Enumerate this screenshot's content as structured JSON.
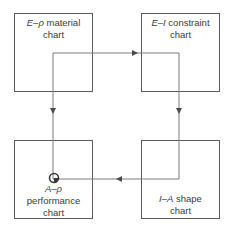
{
  "diagram": {
    "type": "flow-cycle",
    "boxes": [
      {
        "id": "material",
        "var1": "E",
        "dash": "–",
        "var2": "ρ",
        "line1_rest": " material",
        "line2": "chart"
      },
      {
        "id": "constraint",
        "var1": "E",
        "dash": "–",
        "var2": "I",
        "line1_rest": " constraint",
        "line2": "chart"
      },
      {
        "id": "performance",
        "var1": "A",
        "dash": "–",
        "var2": "ρ",
        "line2": "performance",
        "line3": "chart"
      },
      {
        "id": "shape",
        "var1": "I",
        "dash": "–",
        "var2": "A",
        "line1_rest": " shape",
        "line2": "chart"
      }
    ],
    "flow": [
      "material → constraint",
      "constraint → shape",
      "shape → performance",
      "material → performance"
    ],
    "colors": {
      "box_border": "#5a5a5a",
      "line": "#7a7a7a",
      "arrow": "#4a4a4a",
      "text": "#3a3a3a"
    }
  }
}
